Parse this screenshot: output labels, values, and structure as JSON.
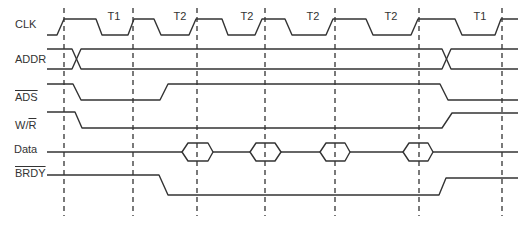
{
  "diagram": {
    "type": "timing-diagram",
    "signals": [
      {
        "id": "clk",
        "label": "CLK",
        "overline": false
      },
      {
        "id": "addr",
        "label": "ADDR",
        "overline": false
      },
      {
        "id": "ads",
        "label": "ADS",
        "overline": true
      },
      {
        "id": "wr",
        "label_w": "W/",
        "label_r": "R",
        "overline_part": "R"
      },
      {
        "id": "data",
        "label": "Data",
        "overline": false
      },
      {
        "id": "brdy",
        "label": "BRDY",
        "overline": true
      }
    ],
    "states": [
      {
        "label": "T1"
      },
      {
        "label": "T2"
      },
      {
        "label": "T2"
      },
      {
        "label": "T2"
      },
      {
        "label": "T2"
      },
      {
        "label": "T1"
      }
    ]
  }
}
